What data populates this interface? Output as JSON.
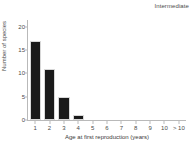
{
  "chart_data": {
    "type": "bar",
    "title": "Intermediate",
    "xlabel": "Age at first reproduction (years)",
    "ylabel": "Number of species",
    "categories": [
      "1",
      "2",
      "3",
      "4",
      "5",
      "6",
      "7",
      "8",
      "9",
      "10",
      "> 10"
    ],
    "values": [
      17,
      11,
      5,
      1,
      0,
      0,
      0,
      0,
      0,
      0,
      0
    ],
    "yticks": [
      0,
      5,
      10,
      15,
      20
    ],
    "ylim": [
      0,
      21
    ],
    "grid": false,
    "legend": null,
    "bar_color": "#1a1a1a",
    "bar_edge_color": "#d8d8d8",
    "axis_color": "#b9b9b9",
    "background": "#ffffff"
  }
}
